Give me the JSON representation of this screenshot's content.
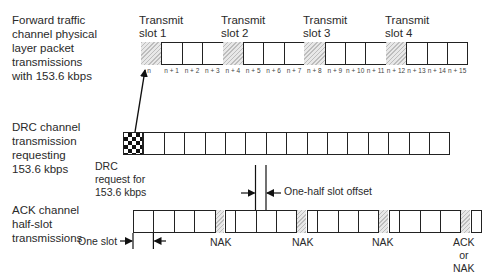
{
  "forward_traffic": {
    "label": "Forward traffic\nchannel physical\nlayer packet\ntransmissions\nwith 153.6 kbps",
    "transmit_slots": [
      {
        "label": "Transmit\nslot 1"
      },
      {
        "label": "Transmit\nslot 2"
      },
      {
        "label": "Transmit\nslot 3"
      },
      {
        "label": "Transmit\nslot 4"
      }
    ],
    "slot_ticks": [
      "n",
      "n + 1",
      "n + 2",
      "n + 3",
      "n + 4",
      "n + 5",
      "n + 6",
      "n + 7",
      "n + 8",
      "n + 9",
      "n + 10",
      "n + 11",
      "n + 12",
      "n + 13",
      "n + 14",
      "n + 15"
    ]
  },
  "drc_channel": {
    "label": "DRC channel\ntransmission\nrequesting\n153.6 kbps",
    "request_label": "DRC\nrequest for\n153.6 kbps",
    "slot_count": 15
  },
  "ack_channel": {
    "label": "ACK channel\nhalf-slot\ntransmissions",
    "one_slot_label": "One slot",
    "half_slot_offset_label": "One-half slot offset",
    "nak_labels": [
      "NAK",
      "NAK",
      "NAK"
    ],
    "final_label": "ACK\nor\nNAK"
  },
  "colors": {
    "line": "#222222",
    "hatch": "#bdbdbd",
    "checker": "#111111"
  }
}
